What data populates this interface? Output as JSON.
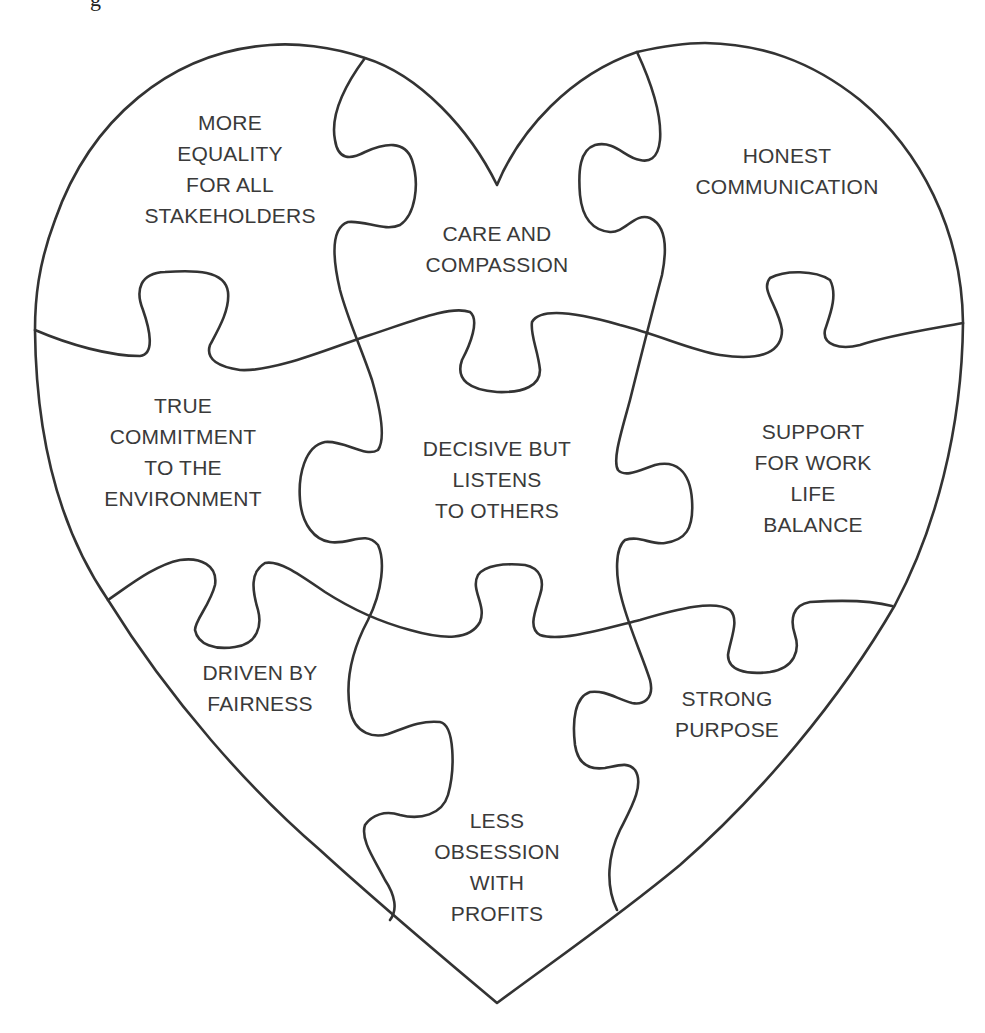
{
  "figure": {
    "type": "heart-shaped jigsaw puzzle",
    "caption_fragment": "g",
    "colors": {
      "background": "#ffffff",
      "line": "#333333",
      "text": "#3a3a3a"
    },
    "pieces": [
      {
        "id": "top-left",
        "label": "MORE\nEQUALITY\nFOR ALL\nSTAKEHOLDERS"
      },
      {
        "id": "top-center",
        "label": "CARE AND\nCOMPASSION"
      },
      {
        "id": "top-right",
        "label": "HONEST\nCOMMUNICATION"
      },
      {
        "id": "middle-left",
        "label": "TRUE\nCOMMITMENT\nTO THE\nENVIRONMENT"
      },
      {
        "id": "middle-center",
        "label": "DECISIVE BUT\nLISTENS\nTO OTHERS"
      },
      {
        "id": "middle-right",
        "label": "SUPPORT\nFOR WORK\nLIFE\nBALANCE"
      },
      {
        "id": "bottom-left",
        "label": "DRIVEN BY\nFAIRNESS"
      },
      {
        "id": "bottom-center",
        "label": "LESS\nOBSESSION\nWITH\nPROFITS"
      },
      {
        "id": "bottom-right",
        "label": "STRONG\nPURPOSE"
      }
    ]
  }
}
